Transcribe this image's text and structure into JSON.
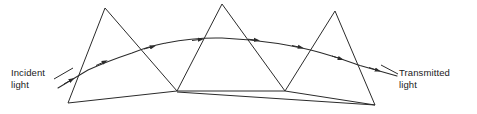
{
  "figure": {
    "stroke_color": "#2b2b2b",
    "background_color": "#ffffff",
    "text_color": "#1a1a1a"
  },
  "labels": {
    "incident": {
      "line1": "Incident",
      "line2": "light"
    },
    "transmitted": {
      "line1": "Transmitted",
      "line2": "light"
    }
  },
  "diagram_data": {
    "type": "optics-ray-diagram",
    "element_count": 3,
    "prisms": [
      {
        "name": "prism-1",
        "apex": [
          105,
          8
        ],
        "left_base": [
          68,
          103
        ],
        "right_base": [
          177,
          91
        ]
      },
      {
        "name": "prism-2",
        "apex": [
          222,
          4
        ],
        "left_base": [
          177,
          91
        ],
        "right_base": [
          285,
          91
        ]
      },
      {
        "name": "prism-3",
        "apex": [
          335,
          11
        ],
        "left_base": [
          285,
          91
        ],
        "right_base": [
          375,
          105
        ]
      }
    ],
    "base_lines": [
      {
        "name": "base-line-left",
        "from": [
          68,
          103
        ],
        "to": [
          177,
          91
        ]
      },
      {
        "name": "base-line-middle",
        "from": [
          177,
          91
        ],
        "to": [
          285,
          91
        ]
      },
      {
        "name": "base-line-right",
        "from": [
          285,
          91
        ],
        "to": [
          375,
          105
        ]
      },
      {
        "name": "base-line-chord",
        "from": [
          177,
          92
        ],
        "to": [
          375,
          105
        ]
      }
    ],
    "ray_path": {
      "name": "light-ray",
      "points": [
        [
          58,
          88
        ],
        [
          88,
          70
        ],
        [
          132,
          53
        ],
        [
          166,
          43
        ],
        [
          222,
          38
        ],
        [
          278,
          43
        ],
        [
          320,
          52
        ],
        [
          360,
          65
        ],
        [
          397,
          76
        ]
      ],
      "direction": "left-to-right"
    },
    "ray_arrow_positions": [
      [
        71,
        80
      ],
      [
        104,
        62
      ],
      [
        152,
        47
      ],
      [
        200,
        40
      ],
      [
        256,
        40
      ],
      [
        300,
        47
      ],
      [
        340,
        58
      ],
      [
        377,
        70
      ]
    ],
    "leader_lines": [
      {
        "name": "leader-incident",
        "from": [
          55,
          78
        ],
        "to": [
          70,
          70
        ]
      },
      {
        "name": "leader-transmitted",
        "from": [
          383,
          66
        ],
        "to": [
          397,
          73
        ]
      }
    ]
  }
}
